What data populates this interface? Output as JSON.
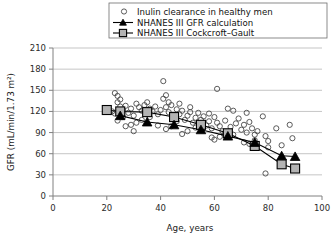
{
  "chart_data": {
    "type": "scatter",
    "title": "",
    "xlabel": "Age, years",
    "ylabel": "GFR  (mL/min/1.73 m²)",
    "xlim": [
      0,
      100
    ],
    "ylim": [
      0,
      210
    ],
    "xticks": [
      0,
      20,
      40,
      60,
      80,
      100
    ],
    "yticks": [
      0,
      30,
      60,
      90,
      120,
      150,
      180,
      210
    ],
    "grid": "horizontal",
    "legend_position": "top-center",
    "series": [
      {
        "name": "Inulin clearance in healthy men",
        "marker": "open-circle",
        "type": "scatter",
        "points": [
          [
            23,
            146
          ],
          [
            24,
            142
          ],
          [
            24,
            133
          ],
          [
            25,
            137
          ],
          [
            25,
            127
          ],
          [
            22,
            120
          ],
          [
            26,
            122
          ],
          [
            23,
            117
          ],
          [
            27,
            128
          ],
          [
            26,
            112
          ],
          [
            24,
            107
          ],
          [
            28,
            118
          ],
          [
            29,
            124
          ],
          [
            30,
            114
          ],
          [
            31,
            131
          ],
          [
            32,
            126
          ],
          [
            33,
            121
          ],
          [
            34,
            129
          ],
          [
            34,
            122
          ],
          [
            35,
            133
          ],
          [
            35,
            118
          ],
          [
            36,
            124
          ],
          [
            36,
            112
          ],
          [
            33,
            108
          ],
          [
            31,
            104
          ],
          [
            29,
            101
          ],
          [
            37,
            120
          ],
          [
            38,
            127
          ],
          [
            39,
            116
          ],
          [
            40,
            122
          ],
          [
            41,
            163
          ],
          [
            41,
            138
          ],
          [
            42,
            143
          ],
          [
            42,
            126
          ],
          [
            43,
            133
          ],
          [
            43,
            119
          ],
          [
            44,
            129
          ],
          [
            45,
            112
          ],
          [
            46,
            123
          ],
          [
            46,
            106
          ],
          [
            44,
            99
          ],
          [
            42,
            95
          ],
          [
            47,
            116
          ],
          [
            48,
            121
          ],
          [
            49,
            108
          ],
          [
            50,
            114
          ],
          [
            51,
            119
          ],
          [
            52,
            104
          ],
          [
            53,
            111
          ],
          [
            54,
            118
          ],
          [
            53,
            97
          ],
          [
            50,
            92
          ],
          [
            48,
            88
          ],
          [
            55,
            108
          ],
          [
            56,
            113
          ],
          [
            57,
            100
          ],
          [
            58,
            106
          ],
          [
            59,
            96
          ],
          [
            60,
            112
          ],
          [
            61,
            152
          ],
          [
            61,
            104
          ],
          [
            62,
            99
          ],
          [
            63,
            92
          ],
          [
            64,
            107
          ],
          [
            65,
            124
          ],
          [
            66,
            98
          ],
          [
            67,
            121
          ],
          [
            68,
            103
          ],
          [
            69,
            110
          ],
          [
            70,
            94
          ],
          [
            64,
            88
          ],
          [
            62,
            84
          ],
          [
            60,
            80
          ],
          [
            71,
            101
          ],
          [
            72,
            118
          ],
          [
            72,
            90
          ],
          [
            73,
            105
          ],
          [
            74,
            96
          ],
          [
            75,
            87
          ],
          [
            76,
            92
          ],
          [
            75,
            79
          ],
          [
            73,
            74
          ],
          [
            78,
            113
          ],
          [
            79,
            85
          ],
          [
            80,
            78
          ],
          [
            80,
            69
          ],
          [
            79,
            32
          ],
          [
            83,
            96
          ],
          [
            85,
            72
          ],
          [
            88,
            101
          ],
          [
            89,
            82
          ],
          [
            30,
            92
          ],
          [
            27,
            99
          ],
          [
            39,
            100
          ],
          [
            58,
            117
          ],
          [
            67,
            87
          ],
          [
            51,
            126
          ],
          [
            47,
            131
          ],
          [
            59,
            83
          ],
          [
            71,
            76
          ]
        ]
      },
      {
        "name": "NHANES III GFR calculation",
        "marker": "black-triangle",
        "type": "line-marker",
        "points": [
          [
            25,
            114
          ],
          [
            35,
            105
          ],
          [
            45,
            101
          ],
          [
            55,
            94
          ],
          [
            65,
            85
          ],
          [
            75,
            76
          ],
          [
            85,
            57
          ],
          [
            90,
            56
          ]
        ]
      },
      {
        "name": "NHANES III Cockcroft-Gault",
        "marker": "open-square",
        "type": "line-marker",
        "points": [
          [
            20,
            122
          ],
          [
            25,
            120
          ],
          [
            35,
            119
          ],
          [
            45,
            112
          ],
          [
            55,
            101
          ],
          [
            65,
            89
          ],
          [
            75,
            71
          ],
          [
            85,
            45
          ],
          [
            90,
            39
          ]
        ]
      }
    ]
  },
  "legend": {
    "entries": [
      {
        "label": "Inulin clearance in healthy men",
        "marker": "circle-icon"
      },
      {
        "label": "NHANES III GFR calculation",
        "marker": "triangle-line-icon"
      },
      {
        "label": "NHANES III Cockcroft–Gault",
        "marker": "square-line-icon"
      }
    ]
  },
  "axes": {
    "y_title": "GFR  (mL/min/1.73 m²)",
    "x_title": "Age, years",
    "y_labels": [
      "210",
      "180",
      "150",
      "120",
      "90",
      "60",
      "30",
      "0"
    ],
    "x_labels": [
      "0",
      "20",
      "40",
      "60",
      "80",
      "100"
    ]
  },
  "colors": {
    "grid": "#b6b6b6",
    "axis": "#808080",
    "scatter_stroke": "#4a4a4a",
    "square_fill": "#b3b3b3",
    "triangle_fill": "#000000",
    "line": "#000000",
    "background": "#ffffff"
  }
}
